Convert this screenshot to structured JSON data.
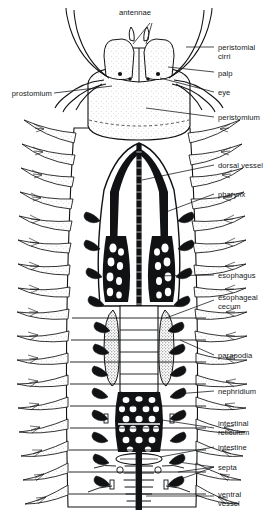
{
  "figure": {
    "organism": "polychaete worm (Nereis)",
    "view": "dorsal dissection",
    "ink_color": "#101214",
    "paper_color": "#ffffff",
    "tint_color": "#d8d8d8"
  },
  "labels": {
    "antennae": "antennae",
    "peristomial_cirri": "peristomial\ncirri",
    "palp": "palp",
    "prostomium": "prostomium",
    "eye": "eye",
    "peristomium": "peristomium",
    "dorsal_vessel": "dorsal vessel",
    "pharynx": "pharynx",
    "esophagus": "esophagus",
    "esophageal_cecum": "esophageal\ncecum",
    "parapodia": "parapodia",
    "nephridium": "nephridium",
    "intestinal_reticulum": "intestinal\nreticulum",
    "intestine": "intestine",
    "septa": "septa",
    "ventral_vessel": "ventral\nvessel"
  },
  "label_positions": {
    "antennae": {
      "x": 124,
      "y": 8,
      "side": "center"
    },
    "peristomial_cirri": {
      "x": 218,
      "y": 43,
      "side": "right"
    },
    "palp": {
      "x": 218,
      "y": 69,
      "side": "right"
    },
    "prostomium": {
      "x": 4,
      "y": 89,
      "side": "left"
    },
    "eye": {
      "x": 218,
      "y": 89,
      "side": "right"
    },
    "peristomium": {
      "x": 218,
      "y": 114,
      "side": "right"
    },
    "dorsal_vessel": {
      "x": 218,
      "y": 162,
      "side": "right"
    },
    "pharynx": {
      "x": 218,
      "y": 191,
      "side": "right"
    },
    "esophagus": {
      "x": 218,
      "y": 272,
      "side": "right"
    },
    "esophageal_cecum": {
      "x": 218,
      "y": 294,
      "side": "right"
    },
    "parapodia": {
      "x": 218,
      "y": 352,
      "side": "right"
    },
    "nephridium": {
      "x": 218,
      "y": 388,
      "side": "right"
    },
    "intestinal_reticulum": {
      "x": 218,
      "y": 420,
      "side": "right"
    },
    "intestine": {
      "x": 218,
      "y": 444,
      "side": "right"
    },
    "septa": {
      "x": 218,
      "y": 464,
      "side": "right"
    },
    "ventral_vessel": {
      "x": 218,
      "y": 491,
      "side": "right"
    }
  },
  "anatomy_counts": {
    "parapodia_per_side": 17,
    "antennae": 2,
    "palps": 2,
    "eyes": 4,
    "peristomial_cirri": 4
  }
}
